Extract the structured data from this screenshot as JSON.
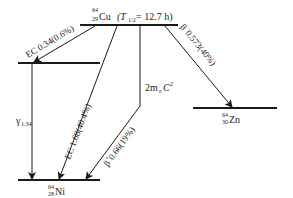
{
  "diagram": {
    "type": "nuclear-decay-scheme",
    "parent": {
      "mass": "64",
      "atomic": "29",
      "symbol": "Cu",
      "halflife_prefix": "(T",
      "halflife_sub": "1/2",
      "halflife_value": " = 12.7 h)"
    },
    "daughters": [
      {
        "mass": "64",
        "atomic": "28",
        "symbol": "Ni"
      },
      {
        "mass": "64",
        "atomic": "30",
        "symbol": "Zn"
      }
    ],
    "transitions": [
      {
        "id": "ec-low",
        "label": "EC 0.34(0.6%)"
      },
      {
        "id": "gamma",
        "label_main": "γ",
        "label_sub": "1.34"
      },
      {
        "id": "ec-high",
        "label": "EC 1.68(40.4%)"
      },
      {
        "id": "pair",
        "label_main": "2m",
        "label_sub": "e",
        "label_tail": "C",
        "label_sup": "2"
      },
      {
        "id": "beta-plus",
        "label_main": "β",
        "label_sup": "+",
        "label_tail": " 0.66(19%)"
      },
      {
        "id": "beta-minus",
        "label_main": "β",
        "label_sup": "−",
        "label_tail": " 0.573(40%)"
      }
    ]
  }
}
